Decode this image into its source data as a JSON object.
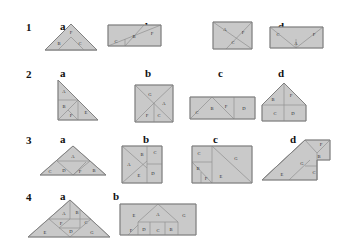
{
  "sheet": {
    "background_color": "#ffffff",
    "piece_fill": "#c9c9c9",
    "piece_stroke": "#8f8f8f",
    "label_color": "#2b2b2b",
    "heading_color": "#111111"
  },
  "rows": [
    {
      "number": "1",
      "columns": [
        {
          "letter": "a",
          "shape": "triangle",
          "pieces": [
            {
              "label": "F",
              "x": 33,
              "y": 9
            },
            {
              "label": "B",
              "x": 21,
              "y": 20
            },
            {
              "label": "C",
              "x": 42,
              "y": 20
            }
          ]
        },
        {
          "letter": "b",
          "shape": "rectangle-diagonal",
          "pieces": [
            {
              "label": "C",
              "x": 8,
              "y": 18
            },
            {
              "label": "B",
              "x": 26,
              "y": 13
            },
            {
              "label": "F",
              "x": 44,
              "y": 10
            }
          ]
        },
        {
          "letter": "c",
          "shape": "square",
          "pieces": [
            {
              "label": "A",
              "x": 12,
              "y": 8
            },
            {
              "label": "F",
              "x": 30,
              "y": 11
            },
            {
              "label": "C",
              "x": 20,
              "y": 21
            }
          ]
        },
        {
          "letter": "d",
          "shape": "rectangle-peak",
          "pieces": [
            {
              "label": "C",
              "x": 8,
              "y": 9
            },
            {
              "label": "A",
              "x": 26,
              "y": 18
            },
            {
              "label": "F",
              "x": 44,
              "y": 9
            }
          ]
        }
      ]
    },
    {
      "number": "2",
      "columns": [
        {
          "letter": "a",
          "shape": "right-triangle",
          "pieces": [
            {
              "label": "A",
              "x": 10,
              "y": 12
            },
            {
              "label": "B",
              "x": 10,
              "y": 27
            },
            {
              "label": "F",
              "x": 17,
              "y": 35
            },
            {
              "label": "E",
              "x": 32,
              "y": 31
            }
          ]
        },
        {
          "letter": "b",
          "shape": "square",
          "pieces": [
            {
              "label": "G",
              "x": 15,
              "y": 10
            },
            {
              "label": "A",
              "x": 29,
              "y": 19
            },
            {
              "label": "F",
              "x": 13,
              "y": 30
            },
            {
              "label": "C",
              "x": 25,
              "y": 31
            }
          ]
        },
        {
          "letter": "c",
          "shape": "wide-rectangle",
          "pieces": [
            {
              "label": "C",
              "x": 7,
              "y": 21
            },
            {
              "label": "B",
              "x": 20,
              "y": 17
            },
            {
              "label": "F",
              "x": 34,
              "y": 15
            },
            {
              "label": "D",
              "x": 52,
              "y": 17
            }
          ]
        },
        {
          "letter": "d",
          "shape": "house",
          "pieces": [
            {
              "label": "B",
              "x": 12,
              "y": 18
            },
            {
              "label": "F",
              "x": 26,
              "y": 14
            },
            {
              "label": "C",
              "x": 16,
              "y": 31
            },
            {
              "label": "D",
              "x": 31,
              "y": 31
            }
          ]
        }
      ]
    },
    {
      "number": "3",
      "columns": [
        {
          "letter": "a",
          "shape": "triangle",
          "pieces": [
            {
              "label": "A",
              "x": 33,
              "y": 12
            },
            {
              "label": "C",
              "x": 10,
              "y": 28
            },
            {
              "label": "D",
              "x": 24,
              "y": 28
            },
            {
              "label": "F",
              "x": 40,
              "y": 29
            },
            {
              "label": "B",
              "x": 54,
              "y": 28
            }
          ]
        },
        {
          "letter": "b",
          "shape": "square",
          "pieces": [
            {
              "label": "B",
              "x": 22,
              "y": 9
            },
            {
              "label": "C",
              "x": 34,
              "y": 7
            },
            {
              "label": "A",
              "x": 8,
              "y": 19
            },
            {
              "label": "E",
              "x": 18,
              "y": 30
            },
            {
              "label": "D",
              "x": 31,
              "y": 29
            }
          ]
        },
        {
          "letter": "c",
          "shape": "rectangle",
          "pieces": [
            {
              "label": "C",
              "x": 7,
              "y": 8
            },
            {
              "label": "G",
              "x": 44,
              "y": 13
            },
            {
              "label": "B",
              "x": 9,
              "y": 22
            },
            {
              "label": "F",
              "x": 13,
              "y": 33
            },
            {
              "label": "E",
              "x": 29,
              "y": 31
            }
          ]
        },
        {
          "letter": "d",
          "shape": "slanted",
          "pieces": [
            {
              "label": "F",
              "x": 54,
              "y": 6
            },
            {
              "label": "B",
              "x": 50,
              "y": 17
            },
            {
              "label": "G",
              "x": 35,
              "y": 22
            },
            {
              "label": "C",
              "x": 49,
              "y": 30
            },
            {
              "label": "E",
              "x": 20,
              "y": 33
            }
          ]
        }
      ]
    },
    {
      "number": "4",
      "columns": [
        {
          "letter": "a",
          "shape": "triangle",
          "pieces": [
            {
              "label": "A",
              "x": 36,
              "y": 14
            },
            {
              "label": "B",
              "x": 52,
              "y": 14
            },
            {
              "label": "C",
              "x": 60,
              "y": 24
            },
            {
              "label": "F",
              "x": 33,
              "y": 26
            },
            {
              "label": "D",
              "x": 45,
              "y": 33
            },
            {
              "label": "E",
              "x": 19,
              "y": 35
            },
            {
              "label": "G",
              "x": 64,
              "y": 35
            }
          ]
        },
        {
          "letter": "b",
          "shape": "rectangle",
          "pieces": [
            {
              "label": "E",
              "x": 14,
              "y": 14
            },
            {
              "label": "A",
              "x": 40,
              "y": 13
            },
            {
              "label": "G",
              "x": 64,
              "y": 14
            },
            {
              "label": "F",
              "x": 12,
              "y": 31
            },
            {
              "label": "D",
              "x": 27,
              "y": 30
            },
            {
              "label": "C",
              "x": 43,
              "y": 31
            },
            {
              "label": "B",
              "x": 58,
              "y": 30
            }
          ]
        }
      ]
    }
  ]
}
